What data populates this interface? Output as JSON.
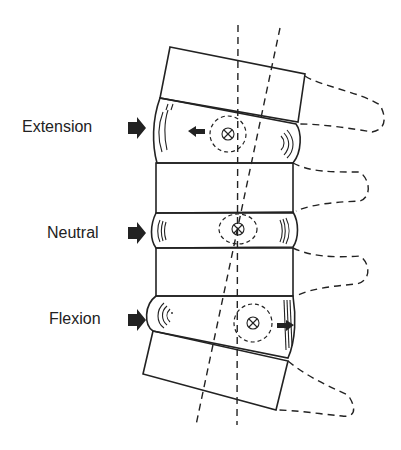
{
  "diagram": {
    "labels": {
      "extension": "Extension",
      "neutral": "Neutral",
      "flexion": "Flexion"
    },
    "colors": {
      "ink": "#222222",
      "background": "#ffffff"
    },
    "elements": [
      "vertebra-top (tilted)",
      "disc-extension",
      "vertebra-middle",
      "disc-neutral",
      "vertebra-lower-middle",
      "disc-flexion",
      "vertebra-bottom (tilted)",
      "vertical-axis (dashed)",
      "tilted-axis (dashed)",
      "nucleus-markers (circled x)",
      "spinous-processes (dashed)"
    ]
  }
}
